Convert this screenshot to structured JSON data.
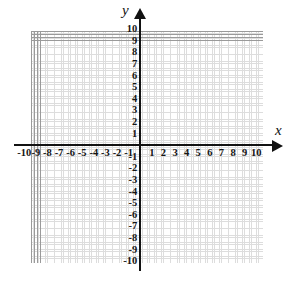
{
  "figure": {
    "type": "cartesian-coordinate-plane",
    "axis_labels": {
      "x": "x",
      "y": "y"
    },
    "colors": {
      "background": "#ffffff",
      "axis": "#121212",
      "major_grid": "#9a9a9a",
      "minor_grid": "#d8d8d8",
      "label": "#151515"
    }
  },
  "chart_data": {
    "type": "scatter",
    "title": "",
    "xlabel": "x",
    "ylabel": "y",
    "xlim": [
      -10,
      10
    ],
    "ylim": [
      -10,
      10
    ],
    "grid": true,
    "legend": false,
    "x_tick_labels": [
      "-10",
      "-9",
      "-8",
      "-7",
      "-6",
      "-5",
      "-4",
      "-3",
      "-2",
      "-1",
      "1",
      "2",
      "3",
      "4",
      "5",
      "6",
      "7",
      "8",
      "9",
      "10"
    ],
    "x_tick_values": [
      -10,
      -9,
      -8,
      -7,
      -6,
      -5,
      -4,
      -3,
      -2,
      -1,
      1,
      2,
      3,
      4,
      5,
      6,
      7,
      8,
      9,
      10
    ],
    "y_tick_labels": [
      "10",
      "9",
      "8",
      "7",
      "6",
      "5",
      "4",
      "3",
      "2",
      "1",
      "-1",
      "-2",
      "-3",
      "-4",
      "-5",
      "-6",
      "-7",
      "-8",
      "-9",
      "-10"
    ],
    "y_tick_values": [
      10,
      9,
      8,
      7,
      6,
      5,
      4,
      3,
      2,
      1,
      -1,
      -2,
      -3,
      -4,
      -5,
      -6,
      -7,
      -8,
      -9,
      -10
    ],
    "series": [],
    "values": [],
    "categories": [],
    "annotations": []
  }
}
